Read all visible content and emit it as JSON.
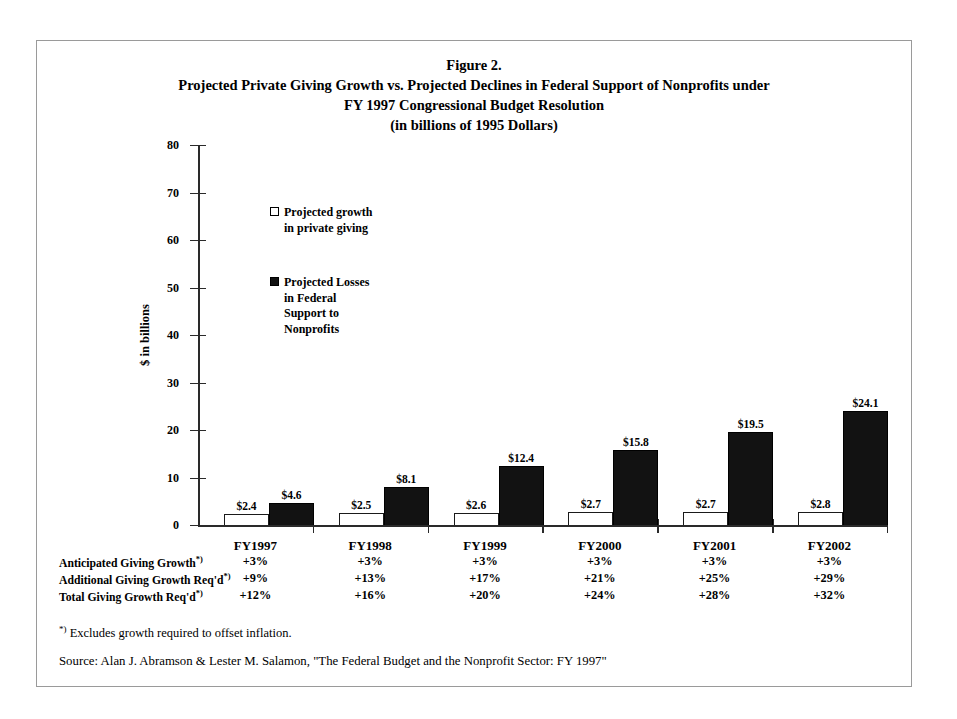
{
  "figure": {
    "title_lines": [
      "Figure 2.",
      "Projected Private Giving Growth vs. Projected Declines in Federal Support of Nonprofits under",
      "FY 1997 Congressional Budget Resolution",
      "(in billions of 1995 Dollars)"
    ],
    "footnote": "Excludes growth required to offset inflation.",
    "footnote_marker": "*)",
    "source": "Source: Alan J. Abramson & Lester M. Salamon, \"The Federal Budget and the Nonprofit Sector: FY 1997\""
  },
  "legend": {
    "entries": [
      {
        "marker": "open-square-icon",
        "lines": [
          "Projected growth",
          "in private giving"
        ]
      },
      {
        "marker": "filled-square-icon",
        "lines": [
          "Projected Losses",
          "in Federal",
          "Support to",
          "Nonprofits"
        ]
      }
    ]
  },
  "axis": {
    "y_label": "$ in billions",
    "y_ticks": [
      "0",
      "10",
      "20",
      "30",
      "40",
      "50",
      "60",
      "70",
      "80"
    ]
  },
  "table": {
    "rows": [
      {
        "label": "Anticipated Giving Growth",
        "marker": "*)",
        "values": [
          "+3%",
          "+3%",
          "+3%",
          "+3%",
          "+3%",
          "+3%"
        ]
      },
      {
        "label": "Additional Giving Growth Req'd",
        "marker": "*)",
        "values": [
          "+9%",
          "+13%",
          "+17%",
          "+21%",
          "+25%",
          "+29%"
        ]
      },
      {
        "label": "Total Giving Growth Req'd",
        "marker": "*)",
        "values": [
          "+12%",
          "+16%",
          "+20%",
          "+24%",
          "+28%",
          "+32%"
        ]
      }
    ]
  },
  "chart_data": {
    "type": "bar",
    "title": "Projected Private Giving Growth vs. Projected Declines in Federal Support of Nonprofits under FY 1997 Congressional Budget Resolution (in billions of 1995 Dollars)",
    "xlabel": "",
    "ylabel": "$ in billions",
    "ylim": [
      0,
      80
    ],
    "ytick_step": 10,
    "grid": false,
    "legend_position": "inside-upper-left",
    "categories": [
      "FY1997",
      "FY1998",
      "FY1999",
      "FY2000",
      "FY2001",
      "FY2002"
    ],
    "series": [
      {
        "name": "Projected growth in private giving",
        "style": "open",
        "values": [
          2.4,
          2.5,
          2.6,
          2.7,
          2.7,
          2.8
        ],
        "labels": [
          "$2.4",
          "$2.5",
          "$2.6",
          "$2.7",
          "$2.7",
          "$2.8"
        ]
      },
      {
        "name": "Projected Losses in Federal Support to Nonprofits",
        "style": "filled",
        "values": [
          4.6,
          8.1,
          12.4,
          15.8,
          19.5,
          24.1
        ],
        "labels": [
          "$4.6",
          "$8.1",
          "$12.4",
          "$15.8",
          "$19.5",
          "$24.1"
        ]
      }
    ]
  }
}
